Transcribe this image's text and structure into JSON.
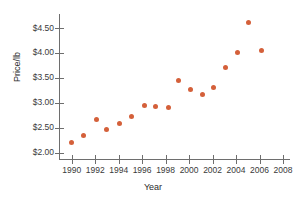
{
  "chart_data": {
    "type": "scatter",
    "title": "",
    "xlabel": "Year",
    "ylabel": "Price/lb",
    "xlim": [
      1989,
      2008.6
    ],
    "ylim": [
      1.85,
      4.78
    ],
    "xticks": [
      1990,
      1992,
      1994,
      1996,
      1998,
      2000,
      2002,
      2004,
      2006,
      2008
    ],
    "xtick_labels": [
      "1990",
      "1992",
      "1994",
      "1996",
      "1998",
      "2000",
      "2002",
      "2004",
      "2006",
      "2008"
    ],
    "yticks": [
      2.0,
      2.5,
      3.0,
      3.5,
      4.0,
      4.5
    ],
    "ytick_labels": [
      "$2.00",
      "$2.50",
      "$3.00",
      "$3.50",
      "$4.00",
      "$4.50"
    ],
    "grid": false,
    "legend": null,
    "marker_color": "#d4603a",
    "axis_color": "#6e6e6e",
    "x": [
      1990.0,
      1991.0,
      1992.1,
      1993.0,
      1994.1,
      1995.1,
      1996.2,
      1997.1,
      1998.2,
      1999.1,
      2000.1,
      2001.1,
      2002.1,
      2003.1,
      2004.1,
      2005.1,
      2006.2
    ],
    "y": [
      2.2,
      2.35,
      2.67,
      2.46,
      2.58,
      2.72,
      2.95,
      2.93,
      2.9,
      3.44,
      3.27,
      3.17,
      3.31,
      3.71,
      4.01,
      4.61,
      4.05
    ],
    "points": [
      {
        "year": "1990",
        "price": "$2.20"
      },
      {
        "year": "1991",
        "price": "$2.35"
      },
      {
        "year": "1992",
        "price": "$2.67"
      },
      {
        "year": "1993",
        "price": "$2.46"
      },
      {
        "year": "1994",
        "price": "$2.58"
      },
      {
        "year": "1995",
        "price": "$2.72"
      },
      {
        "year": "1996",
        "price": "$2.95"
      },
      {
        "year": "1997",
        "price": "$2.93"
      },
      {
        "year": "1998",
        "price": "$2.90"
      },
      {
        "year": "1999",
        "price": "$3.44"
      },
      {
        "year": "2000",
        "price": "$3.27"
      },
      {
        "year": "2001",
        "price": "$3.17"
      },
      {
        "year": "2002",
        "price": "$3.31"
      },
      {
        "year": "2003",
        "price": "$3.71"
      },
      {
        "year": "2004",
        "price": "$4.01"
      },
      {
        "year": "2005",
        "price": "$4.61"
      },
      {
        "year": "2006",
        "price": "$4.05"
      }
    ]
  }
}
